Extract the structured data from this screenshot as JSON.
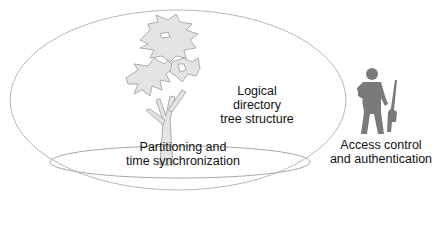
{
  "diagram": {
    "outer_ellipse": {
      "name": "directory-scope",
      "stroke": "#b8b8b8"
    },
    "tree": {
      "icon": "tree-icon",
      "fill": "#e4e4e4",
      "stroke": "#9a9a9a",
      "label_lines": [
        "Logical",
        "directory",
        "tree structure"
      ]
    },
    "inner_ellipse": {
      "stroke": "#a8a8a8",
      "label_lines": [
        "Partitioning and",
        "time synchronization"
      ]
    },
    "guard": {
      "icon": "armed-guard-icon",
      "fill": "#7a7a7a",
      "label_lines": [
        "Access control",
        "and authentication"
      ]
    }
  }
}
